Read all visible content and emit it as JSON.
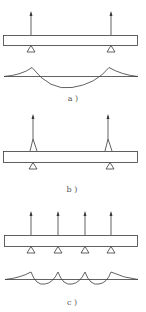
{
  "figure": {
    "panels": [
      {
        "id": "a",
        "label": "a )",
        "beam": {
          "x": 3,
          "y": 35,
          "width": 135,
          "height": 10
        },
        "supports_x": [
          31,
          111
        ],
        "arrow_top_y": 13,
        "arrow_style": "straight",
        "diagram": {
          "baseline_y": 76,
          "description": "moment curve: hogging peaks over supports, sagging span between"
        }
      },
      {
        "id": "b",
        "label": "b )",
        "beam": {
          "x": 3,
          "y": 151,
          "width": 135,
          "height": 11
        },
        "supports_x": [
          33,
          108
        ],
        "arrow_top_y": 116,
        "arrow_style": "flared"
      },
      {
        "id": "c",
        "label": "c )",
        "beam": {
          "x": 3,
          "y": 235,
          "width": 135,
          "height": 11
        },
        "supports_x": [
          31,
          58,
          85,
          111
        ],
        "arrow_top_y": 213,
        "arrow_style": "straight",
        "diagram": {
          "baseline_y": 279,
          "description": "moment curve: four hogging peaks over supports with three small sagging spans"
        }
      }
    ],
    "colors": {
      "line": "#3a3a3a",
      "label": "#555555",
      "background": "#ffffff"
    }
  }
}
